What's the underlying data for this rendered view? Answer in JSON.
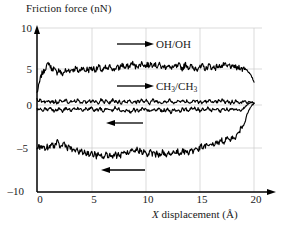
{
  "chart_data": {
    "type": "line",
    "title": "",
    "xlabel": "X displacement (Å)",
    "ylabel": "Friction force (nN)",
    "xlim": [
      0,
      21.5
    ],
    "ylim": [
      -10,
      10
    ],
    "xticks": [
      "0",
      "5",
      "10",
      "15",
      "20"
    ],
    "xtick_values": [
      0,
      5,
      10,
      15,
      20
    ],
    "yticks": [
      "10",
      "5",
      "0",
      "–5",
      "–10"
    ],
    "ytick_values": [
      10,
      5,
      0,
      -5,
      -10
    ],
    "grid": "light vertical gridlines at x=5,10,15,20 and horizontal lines at y=10,5,0,-5",
    "legend": "inline labels with direction arrows",
    "annotations": [
      {
        "name": "oh-oh-forward-label",
        "text": "OH/OH",
        "arrow": "right",
        "x": 10.5,
        "y": 7.4
      },
      {
        "name": "ch3-ch3-forward-label",
        "text": "CH3/CH3",
        "arrow": "right",
        "x": 10.5,
        "y": 2.2
      },
      {
        "name": "ch3-ch3-reverse-arrow",
        "text": "",
        "arrow": "left",
        "x": 9.5,
        "y": -2.0
      },
      {
        "name": "oh-oh-reverse-arrow",
        "text": "",
        "arrow": "left",
        "x": 9.0,
        "y": -7.8
      }
    ],
    "series": [
      {
        "name": "OH/OH forward (trace)",
        "direction": "forward",
        "mean": 4.9,
        "values": [
          1.6,
          2.4,
          3.4,
          4.1,
          4.3,
          4.8,
          5.1,
          5.5,
          5.0,
          4.6,
          4.8,
          4.4,
          4.2,
          4.6,
          4.3,
          3.9,
          4.2,
          4.5,
          4.3,
          4.6,
          4.4,
          4.7,
          4.5,
          4.8,
          4.6,
          4.3,
          4.6,
          4.9,
          4.6,
          4.4,
          4.7,
          4.5,
          4.9,
          4.6,
          4.8,
          4.5,
          4.7,
          5.0,
          4.7,
          4.4,
          4.6,
          4.9,
          4.6,
          4.8,
          5.1,
          4.8,
          4.5,
          4.8,
          5.0,
          4.7,
          5.0,
          5.3,
          5.0,
          4.8,
          5.1,
          4.9,
          5.2,
          5.5,
          5.2,
          4.9,
          5.2,
          5.0,
          5.3,
          5.5,
          5.2,
          5.0,
          5.3,
          5.1,
          5.4,
          5.2,
          5.5,
          5.2,
          5.0,
          5.3,
          5.1,
          4.8,
          5.1,
          4.9,
          5.2,
          5.0,
          4.7,
          5.0,
          4.8,
          5.1,
          4.9,
          5.2,
          5.0,
          4.7,
          5.0,
          5.3,
          5.1,
          4.8,
          5.1,
          4.9,
          4.6,
          4.9,
          4.7,
          5.0,
          4.8,
          5.1,
          4.9,
          4.6,
          4.9,
          5.2,
          5.0,
          4.7,
          5.0,
          4.8,
          5.1,
          4.9,
          5.2,
          5.0,
          5.3,
          5.1,
          4.9,
          5.2,
          5.0,
          4.8,
          5.1,
          4.9,
          4.7,
          5.0,
          4.8,
          4.6,
          4.9,
          4.7,
          4.5,
          4.2,
          3.9,
          3.5,
          3.0
        ]
      },
      {
        "name": "CH3/CH3 forward (trace)",
        "direction": "forward",
        "mean": 0.45,
        "values": [
          0.8,
          0.5,
          0.7,
          0.4,
          0.6,
          0.3,
          0.5,
          0.7,
          0.4,
          0.6,
          0.3,
          0.5,
          0.2,
          0.4,
          0.6,
          0.3,
          0.5,
          0.7,
          0.4,
          0.2,
          0.5,
          0.3,
          0.6,
          0.4,
          0.7,
          0.5,
          0.2,
          0.4,
          0.6,
          0.3,
          0.5,
          0.7,
          0.4,
          0.6,
          0.3,
          0.5,
          0.2,
          0.4,
          0.7,
          0.5,
          0.3,
          0.6,
          0.4,
          0.2,
          0.5,
          0.7,
          0.4,
          0.6,
          0.3,
          0.5,
          0.2,
          0.4,
          0.6,
          0.3,
          0.5,
          0.7,
          0.4,
          0.2,
          0.5,
          0.3,
          0.6,
          0.4,
          0.7,
          0.5,
          0.3,
          0.6,
          0.4,
          0.2,
          0.5,
          0.7,
          0.4,
          0.6,
          0.3,
          0.5,
          0.2,
          0.4,
          0.6,
          0.3,
          0.5,
          0.7,
          0.4,
          0.2,
          0.5,
          0.3,
          0.6,
          0.4,
          0.7,
          0.5,
          0.3,
          0.6,
          0.4,
          0.2,
          0.5,
          0.7,
          0.4,
          0.6,
          0.3,
          0.5,
          0.2,
          0.4,
          0.6,
          0.3,
          0.5,
          0.7,
          0.4,
          0.2,
          0.5,
          0.3,
          0.6,
          0.4,
          0.7,
          0.5,
          0.3,
          0.6,
          0.4,
          0.2,
          0.5,
          0.3,
          0.6,
          0.4,
          0.2,
          0.5,
          0.3,
          0.6,
          0.4,
          0.2,
          0.5,
          0.3,
          0.4,
          0.2
        ]
      },
      {
        "name": "CH3/CH3 reverse (retrace)",
        "direction": "reverse",
        "mean": -0.55,
        "values": [
          -0.4,
          -0.7,
          -0.5,
          -0.8,
          -0.6,
          -0.4,
          -0.7,
          -0.5,
          -0.3,
          -0.6,
          -0.8,
          -0.5,
          -0.7,
          -0.4,
          -0.6,
          -0.9,
          -0.6,
          -0.4,
          -0.7,
          -0.5,
          -0.8,
          -0.6,
          -0.3,
          -0.6,
          -0.4,
          -0.7,
          -0.5,
          -0.8,
          -0.6,
          -0.4,
          -0.7,
          -0.5,
          -0.3,
          -0.6,
          -0.8,
          -0.5,
          -0.7,
          -0.4,
          -0.6,
          -0.9,
          -0.6,
          -0.4,
          -0.7,
          -0.5,
          -0.8,
          -0.6,
          -0.3,
          -0.6,
          -0.4,
          -0.7,
          -0.9,
          -0.6,
          -0.8,
          -0.5,
          -0.7,
          -1.0,
          -0.7,
          -0.5,
          -0.8,
          -0.6,
          -0.9,
          -0.7,
          -0.4,
          -0.7,
          -0.5,
          -0.8,
          -0.6,
          -0.9,
          -0.7,
          -0.5,
          -0.8,
          -0.6,
          -0.4,
          -0.7,
          -0.9,
          -0.6,
          -0.8,
          -0.5,
          -0.7,
          -1.0,
          -0.7,
          -0.5,
          -0.8,
          -0.6,
          -0.9,
          -0.7,
          -0.4,
          -0.7,
          -0.5,
          -0.8,
          -0.6,
          -0.3,
          -0.6,
          -0.4,
          -0.7,
          -0.5,
          -0.8,
          -0.6,
          -0.4,
          -0.7,
          -0.5,
          -0.3,
          -0.6,
          -0.8,
          -0.5,
          -0.7,
          -0.4,
          -0.6,
          -0.9,
          -0.6,
          -0.4,
          -0.7,
          -0.5,
          -0.8,
          -0.6,
          -0.3,
          -0.6,
          -0.4,
          -0.7,
          -0.5,
          -0.8,
          -0.6,
          -0.4,
          -0.2,
          0.0,
          0.2,
          0.3,
          0.3,
          0.2
        ]
      },
      {
        "name": "OH/OH reverse (retrace)",
        "direction": "reverse",
        "mean": -5.6,
        "values": [
          -5.7,
          -5.3,
          -5.6,
          -5.2,
          -5.5,
          -5.8,
          -5.4,
          -5.7,
          -5.3,
          -5.0,
          -5.4,
          -5.1,
          -4.8,
          -5.2,
          -5.5,
          -5.2,
          -4.9,
          -5.3,
          -5.6,
          -5.3,
          -5.7,
          -6.0,
          -5.7,
          -6.1,
          -5.8,
          -6.2,
          -5.9,
          -6.3,
          -6.0,
          -6.4,
          -6.1,
          -6.5,
          -6.2,
          -6.6,
          -6.3,
          -6.7,
          -6.4,
          -6.8,
          -6.5,
          -6.9,
          -6.6,
          -6.3,
          -6.7,
          -6.4,
          -6.8,
          -6.5,
          -6.2,
          -6.6,
          -6.3,
          -6.7,
          -6.4,
          -6.0,
          -6.4,
          -6.1,
          -6.5,
          -6.2,
          -5.9,
          -6.3,
          -6.0,
          -5.7,
          -6.1,
          -5.8,
          -6.2,
          -5.9,
          -6.3,
          -6.6,
          -6.3,
          -6.0,
          -6.4,
          -6.1,
          -6.5,
          -6.2,
          -6.6,
          -6.3,
          -6.0,
          -6.4,
          -6.7,
          -6.4,
          -6.1,
          -6.5,
          -6.2,
          -5.9,
          -6.3,
          -6.0,
          -6.4,
          -6.1,
          -5.8,
          -6.2,
          -5.9,
          -6.3,
          -6.0,
          -5.7,
          -6.1,
          -5.8,
          -5.5,
          -5.9,
          -5.6,
          -5.3,
          -5.7,
          -5.4,
          -5.1,
          -5.5,
          -5.2,
          -4.9,
          -5.3,
          -5.0,
          -4.7,
          -5.1,
          -4.8,
          -4.5,
          -4.9,
          -4.6,
          -4.3,
          -4.7,
          -4.4,
          -4.1,
          -4.5,
          -4.2,
          -3.9,
          -3.6,
          -3.2,
          -2.8,
          -2.3,
          -1.8,
          -1.2,
          -0.7,
          -0.3,
          0.0,
          0.2
        ]
      }
    ]
  },
  "axes": {
    "y_title": "Friction force (nN)",
    "x_title_prefix": "X",
    "x_title_rest": " displacement (Å)"
  },
  "labels": {
    "oh_oh": "OH/OH",
    "ch3_ch3_a": "CH",
    "ch3_ch3_sub1": "3",
    "ch3_ch3_mid": "/CH",
    "ch3_ch3_sub2": "3"
  },
  "colors": {
    "trace": "#000000",
    "axis": "#000000",
    "grid": "#cccccc",
    "background": "#ffffff"
  }
}
